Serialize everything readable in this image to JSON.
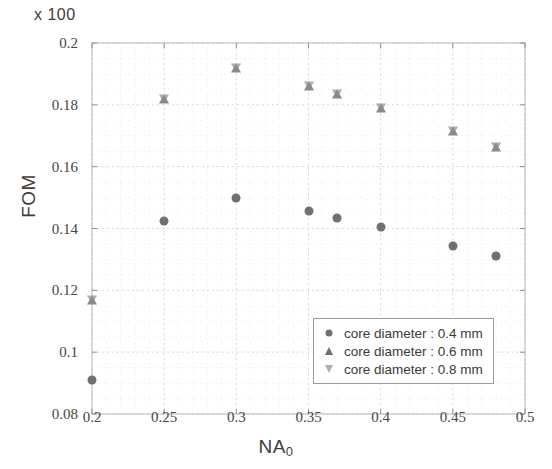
{
  "chart_data": {
    "type": "scatter",
    "title": "",
    "multiplier_label": "x 100",
    "xlabel_main": "NA",
    "xlabel_sub": "0",
    "ylabel": "FOM",
    "xlim": [
      0.2,
      0.5
    ],
    "ylim": [
      0.08,
      0.2
    ],
    "grid": true,
    "legend_position": "lower-right",
    "xticks": [
      "0.2",
      "0.25",
      "0.3",
      "0.35",
      "0.4",
      "0.45",
      "0.5"
    ],
    "xtick_values": [
      0.2,
      0.25,
      0.3,
      0.35,
      0.4,
      0.45,
      0.5
    ],
    "yticks": [
      "0.08",
      "0.1",
      "0.12",
      "0.14",
      "0.16",
      "0.18",
      "0.2"
    ],
    "ytick_values": [
      0.08,
      0.1,
      0.12,
      0.14,
      0.16,
      0.18,
      0.2
    ],
    "series": [
      {
        "name": "core diameter : 0.4 mm",
        "marker": "circle",
        "color": "#707070",
        "x": [
          0.2,
          0.25,
          0.3,
          0.35,
          0.37,
          0.4,
          0.45,
          0.48
        ],
        "y": [
          0.091,
          0.1425,
          0.15,
          0.1455,
          0.1435,
          0.1405,
          0.1345,
          0.131
        ]
      },
      {
        "name": "core diameter : 0.6 mm",
        "marker": "triangle-up",
        "color": "#8a8a8a",
        "x": [
          0.2,
          0.25,
          0.3,
          0.35,
          0.37,
          0.4,
          0.45,
          0.48
        ],
        "y": [
          0.117,
          0.182,
          0.192,
          0.186,
          0.1835,
          0.179,
          0.1715,
          0.1665
        ]
      },
      {
        "name": "core diameter : 0.8 mm",
        "marker": "triangle-down",
        "color": "#aeaeae",
        "x": [
          0.2,
          0.25,
          0.3,
          0.35,
          0.37,
          0.4,
          0.45,
          0.48
        ],
        "y": [
          0.117,
          0.182,
          0.192,
          0.186,
          0.1835,
          0.179,
          0.1715,
          0.1665
        ]
      }
    ]
  },
  "legend": {
    "items": [
      {
        "label": "core diameter : 0.4 mm",
        "marker": "circle"
      },
      {
        "label": "core diameter : 0.6 mm",
        "marker": "triangle-up"
      },
      {
        "label": "core diameter : 0.8 mm",
        "marker": "triangle-down"
      }
    ]
  }
}
